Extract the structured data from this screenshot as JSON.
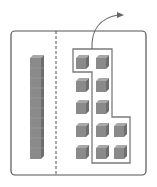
{
  "diagram": {
    "left_panel": {
      "rod_count": 1,
      "cubes_in_rod": 10
    },
    "right_panel": {
      "unit_cube_rows": [
        2,
        2,
        2,
        3,
        3
      ],
      "total_units": 12,
      "grouped_units": 8,
      "arrow": "curved-arrow-up-right"
    },
    "colors": {
      "frame": "#555555",
      "cube_fill": "#8a8a8a",
      "cube_top": "#a8a8a8",
      "cube_side": "#6e6e6e",
      "outline": "#7a7a7a",
      "dashed_divider": "#555555"
    }
  }
}
